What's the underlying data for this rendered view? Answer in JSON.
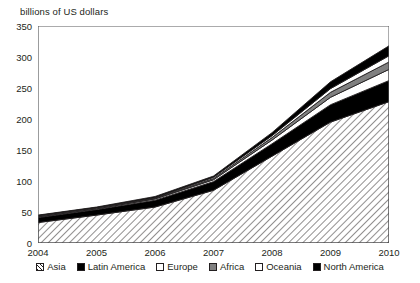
{
  "chart_data": {
    "type": "area",
    "title": "",
    "subtitle": "",
    "ylabel": "billions of US dollars",
    "xlabel": "",
    "grid": false,
    "stacked": true,
    "legend_position": "bottom",
    "ylim": [
      0,
      350
    ],
    "yticks": [
      0,
      50,
      100,
      150,
      200,
      250,
      300,
      350
    ],
    "ytick_labels": [
      "0",
      "50",
      "100",
      "150",
      "200",
      "250",
      "300",
      "350"
    ],
    "x": [
      2004,
      2005,
      2006,
      2007,
      2008,
      2009,
      2010
    ],
    "xtick_labels": [
      "2004",
      "2005",
      "2006",
      "2007",
      "2008",
      "2009",
      "2010"
    ],
    "categories": [
      "2004",
      "2005",
      "2006",
      "2007",
      "2008",
      "2009",
      "2010"
    ],
    "series": [
      {
        "name": "Asia",
        "fill": "hatch",
        "color": "#ffffff",
        "values": [
          33,
          45,
          58,
          85,
          140,
          195,
          228
        ]
      },
      {
        "name": "Latin America",
        "fill": "solid",
        "color": "#000000",
        "values": [
          8,
          9,
          11,
          14,
          20,
          28,
          34
        ]
      },
      {
        "name": "Europe",
        "fill": "solid",
        "color": "#ffffff",
        "values": [
          1,
          1,
          2,
          3,
          6,
          12,
          18
        ]
      },
      {
        "name": "Africa",
        "fill": "solid",
        "color": "#808080",
        "values": [
          1,
          1,
          1,
          2,
          4,
          8,
          12
        ]
      },
      {
        "name": "Oceania",
        "fill": "solid",
        "color": "#ffffff",
        "values": [
          1,
          1,
          1,
          2,
          3,
          6,
          10
        ]
      },
      {
        "name": "North America",
        "fill": "solid",
        "color": "#000000",
        "values": [
          1,
          1,
          2,
          2,
          5,
          11,
          16
        ]
      }
    ],
    "totals": [
      45,
      58,
      75,
      108,
      178,
      260,
      318
    ]
  },
  "legend": {
    "items": [
      {
        "label": "Asia",
        "swatch": "hatch"
      },
      {
        "label": "Latin America",
        "swatch": "black"
      },
      {
        "label": "Europe",
        "swatch": "white"
      },
      {
        "label": "Africa",
        "swatch": "gray"
      },
      {
        "label": "Oceania",
        "swatch": "white"
      },
      {
        "label": "North America",
        "swatch": "black"
      }
    ]
  },
  "colors": {
    "axis": "#58595b",
    "text": "#231f20",
    "black": "#000000",
    "gray": "#808080",
    "white": "#ffffff"
  }
}
